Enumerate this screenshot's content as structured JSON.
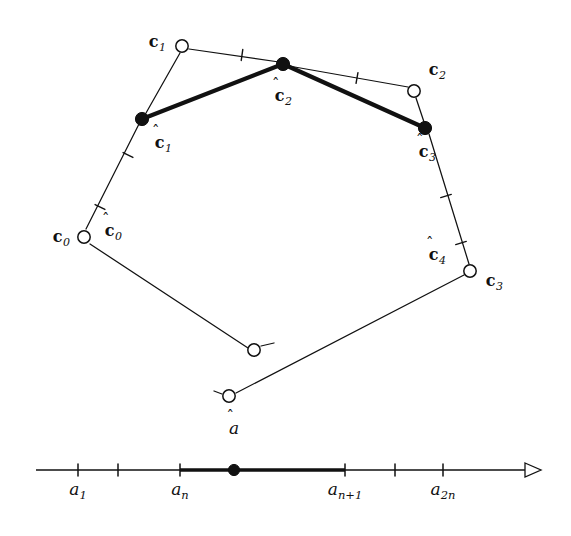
{
  "figure": {
    "background_color": "#ffffff",
    "stroke_color": "#111111",
    "open_marker_fill": "#ffffff",
    "filled_marker_fill": "#111111"
  },
  "polygon": {
    "control_points": [
      {
        "id": "c0",
        "label_base": "c",
        "label_sub": "0",
        "x": 84,
        "y": 237,
        "marker": "open-circle",
        "label_x": 61,
        "label_y": 237
      },
      {
        "id": "c1",
        "label_base": "c",
        "label_sub": "1",
        "x": 182,
        "y": 46,
        "marker": "open-circle",
        "label_x": 157,
        "label_y": 42
      },
      {
        "id": "c2",
        "label_base": "c",
        "label_sub": "2",
        "x": 414,
        "y": 91,
        "marker": "open-circle",
        "label_x": 437,
        "label_y": 70
      },
      {
        "id": "c3",
        "label_base": "c",
        "label_sub": "3",
        "x": 470,
        "y": 271,
        "marker": "open-circle",
        "label_x": 494,
        "label_y": 281
      },
      {
        "id": "c4",
        "label_base": "",
        "label_sub": "",
        "x": 254,
        "y": 350,
        "marker": "open-circle",
        "label_x": 0,
        "label_y": 0
      },
      {
        "id": "c5",
        "label_base": "",
        "label_sub": "",
        "x": 229,
        "y": 396,
        "marker": "open-circle",
        "label_x": 0,
        "label_y": 0
      }
    ],
    "midpoints": [
      {
        "id": "chat0",
        "label_base": "c",
        "label_sub": "0",
        "x": 100,
        "y": 206,
        "marker": "none",
        "label_x": 113,
        "label_y": 231
      },
      {
        "id": "chat1",
        "label_base": "c",
        "label_sub": "1",
        "x": 142,
        "y": 119,
        "marker": "filled-dot",
        "label_x": 163,
        "label_y": 143
      },
      {
        "id": "chat2",
        "label_base": "c",
        "label_sub": "2",
        "x": 283,
        "y": 64,
        "marker": "filled-dot",
        "label_x": 283,
        "label_y": 96
      },
      {
        "id": "chat3",
        "label_base": "c",
        "label_sub": "3",
        "x": 425,
        "y": 128,
        "marker": "filled-dot",
        "label_x": 427,
        "label_y": 152
      },
      {
        "id": "chat4",
        "label_base": "c",
        "label_sub": "4",
        "x": 461,
        "y": 243,
        "marker": "none",
        "label_x": 437,
        "label_y": 255
      }
    ],
    "thin_edges": [
      {
        "from": "c1",
        "to": "chat2",
        "x1": 189,
        "y1": 49,
        "x2": 279,
        "y2": 62
      },
      {
        "from": "chat2",
        "to": "c2",
        "x1": 289,
        "y1": 66,
        "x2": 408,
        "y2": 87
      },
      {
        "from": "c2",
        "to": "chat3",
        "x1": 416,
        "y1": 98,
        "x2": 424,
        "y2": 122
      },
      {
        "from": "chat3",
        "to": "c3",
        "x1": 429,
        "y1": 134,
        "x2": 469,
        "y2": 264
      },
      {
        "from": "c3",
        "to": "c5",
        "x1": 464,
        "y1": 275,
        "x2": 236,
        "y2": 393
      },
      {
        "from": "c5",
        "to": "c4",
        "x1": 222,
        "y1": 394,
        "x2": 214,
        "y2": 391
      },
      {
        "from": "c4",
        "to": "c0",
        "x1": 248,
        "y1": 348,
        "x2": 90,
        "y2": 244
      },
      {
        "from": "c4stub",
        "to": "c4",
        "x1": 261,
        "y1": 346,
        "x2": 274,
        "y2": 343
      },
      {
        "from": "c0",
        "to": "chat1",
        "x1": 86,
        "y1": 229,
        "x2": 139,
        "y2": 124
      },
      {
        "from": "chat1",
        "to": "c1",
        "x1": 146,
        "y1": 113,
        "x2": 180,
        "y2": 53
      }
    ],
    "bold_polyline": [
      {
        "x": 142,
        "y": 119
      },
      {
        "x": 283,
        "y": 64
      },
      {
        "x": 425,
        "y": 128
      }
    ],
    "edge_ticks": [
      {
        "x": 242,
        "y": 55,
        "angle": 8
      },
      {
        "x": 357,
        "y": 78,
        "angle": 10
      },
      {
        "x": 446,
        "y": 196,
        "angle": 73
      },
      {
        "x": 461,
        "y": 243,
        "angle": 73
      },
      {
        "x": 128,
        "y": 155,
        "angle": -63
      },
      {
        "x": 100,
        "y": 207,
        "angle": -63
      }
    ]
  },
  "axis": {
    "y": 470,
    "x_start": 36,
    "x_end": 541,
    "arrow_label": "arrow-right",
    "bold_from": 180,
    "bold_to": 345,
    "hat_point": {
      "id": "ahat",
      "label_base": "a",
      "x": 234,
      "y": 470,
      "label_x": 234,
      "label_y": 428
    },
    "ticks": [
      {
        "x": 78,
        "label_base": "a",
        "label_sub": "1",
        "labeled": true,
        "label_x": 78,
        "label_y": 481
      },
      {
        "x": 118,
        "label_base": "",
        "label_sub": "",
        "labeled": false,
        "label_x": 0,
        "label_y": 0
      },
      {
        "x": 180,
        "label_base": "a",
        "label_sub": "n",
        "labeled": true,
        "label_x": 180,
        "label_y": 481
      },
      {
        "x": 345,
        "label_base": "a",
        "label_sub": "n+1",
        "labeled": true,
        "label_x": 345,
        "label_y": 481
      },
      {
        "x": 395,
        "label_base": "",
        "label_sub": "",
        "labeled": false,
        "label_x": 0,
        "label_y": 0
      },
      {
        "x": 443,
        "label_base": "a",
        "label_sub": "2n",
        "labeled": true,
        "label_x": 443,
        "label_y": 481
      }
    ]
  }
}
